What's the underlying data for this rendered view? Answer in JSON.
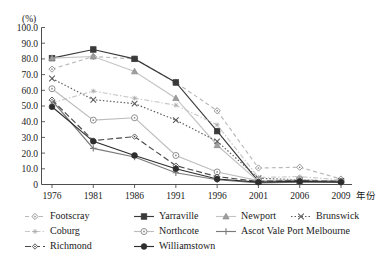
{
  "chart_data": {
    "type": "line",
    "title": "",
    "subtitle": "",
    "unit_label": "(%)",
    "xlabel": "年份",
    "ylabel": "",
    "grid": false,
    "legend_position": "bottom",
    "ylim": [
      0,
      100
    ],
    "ytick_labels": [
      "0",
      "10.0",
      "20.0",
      "30.0",
      "40.0",
      "50.0",
      "60.0",
      "70.0",
      "80.0",
      "90.0",
      "100.0"
    ],
    "ytick_values": [
      0,
      10,
      20,
      30,
      40,
      50,
      60,
      70,
      80,
      90,
      100
    ],
    "categories": [
      "1976",
      "1981",
      "1986",
      "1991",
      "1996",
      "2001",
      "2006",
      "2009"
    ],
    "series": [
      {
        "name": "Footscray",
        "marker": "diamond-open",
        "dash": "4,3",
        "color": "#b9b9b9",
        "values": [
          73.5,
          81.5,
          80.0,
          65.0,
          47.0,
          10.5,
          11.0,
          3.5
        ]
      },
      {
        "name": "Yarraville",
        "marker": "square-filled",
        "dash": "none",
        "color": "#3a3a3a",
        "values": [
          80.5,
          86.0,
          80.0,
          65.0,
          34.0,
          2.0,
          2.5,
          2.0
        ]
      },
      {
        "name": "Newport",
        "marker": "triangle-filled",
        "dash": "none",
        "color": "#c4c4c4",
        "values": [
          80.5,
          81.5,
          72.0,
          55.0,
          25.0,
          2.0,
          2.0,
          1.5
        ]
      },
      {
        "name": "Brunswick",
        "marker": "cross-x",
        "dash": "1.5,2",
        "color": "#5a5a5a",
        "values": [
          67.5,
          54.0,
          51.5,
          41.0,
          27.5,
          4.0,
          3.0,
          2.0
        ]
      },
      {
        "name": "Coburg",
        "marker": "star-small",
        "dash": "5,2,1.5,2",
        "color": "#c9c9c9",
        "values": [
          52.0,
          59.5,
          55.0,
          50.5,
          38.0,
          4.5,
          5.0,
          3.0
        ]
      },
      {
        "name": "Northcote",
        "marker": "circle-open",
        "dash": "none",
        "color": "#bdbdbd",
        "values": [
          61.0,
          41.0,
          42.5,
          18.5,
          8.0,
          2.5,
          3.0,
          2.0
        ]
      },
      {
        "name": "Ascot Vale Port Melbourne",
        "marker": "plus",
        "dash": "none",
        "color": "#7a7a7a",
        "values": [
          53.5,
          23.0,
          17.5,
          7.5,
          3.0,
          1.0,
          1.5,
          1.5
        ]
      },
      {
        "name": "Richmond",
        "marker": "diamond-small",
        "dash": "6,3",
        "color": "#4a4a4a",
        "values": [
          54.0,
          28.0,
          30.5,
          12.0,
          5.0,
          2.0,
          2.5,
          2.0
        ]
      },
      {
        "name": "Williamstown",
        "marker": "circle-filled",
        "dash": "none",
        "color": "#2e2e2e",
        "values": [
          49.5,
          27.5,
          18.5,
          10.0,
          3.5,
          1.5,
          2.0,
          1.5
        ]
      }
    ]
  },
  "legend": {
    "rows": [
      [
        "Footscray",
        "Yarraville",
        "Newport",
        "Brunswick"
      ],
      [
        "Coburg",
        "Northcote",
        "Ascot Vale Port Melbourne"
      ],
      [
        "Richmond",
        "Williamstown"
      ]
    ]
  }
}
